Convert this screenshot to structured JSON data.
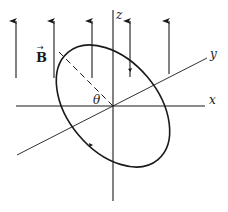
{
  "diagram": {
    "labels": {
      "field": "B",
      "field_vector_mark": "→",
      "angle": "θ",
      "x_axis": "x",
      "y_axis": "y",
      "z_axis": "z"
    },
    "colors": {
      "ink": "#1a1a1a",
      "background": "#ffffff"
    },
    "field_arrows": [
      {
        "x": 16,
        "y_top": 20,
        "y_bottom": 78
      },
      {
        "x": 54,
        "y_top": 20,
        "y_bottom": 78
      },
      {
        "x": 92,
        "y_top": 20,
        "y_bottom": 78
      },
      {
        "x": 130,
        "y_top": 20,
        "y_bottom": 77
      },
      {
        "x": 169,
        "y_top": 20,
        "y_bottom": 74
      }
    ],
    "origin": {
      "x": 113,
      "y": 106
    },
    "loop": {
      "shape": "ellipse",
      "rotation_deg": 40,
      "current_direction_marks": 2
    }
  }
}
